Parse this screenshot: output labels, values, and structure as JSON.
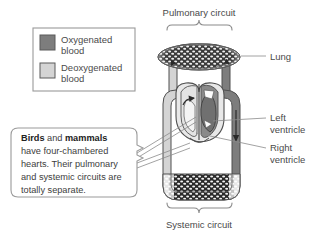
{
  "diagram": {
    "title_top": "Pulmonary circuit",
    "title_bottom": "Systemic circuit",
    "labels": {
      "lung": "Lung",
      "left_ventricle_line1": "Left",
      "left_ventricle_line2": "ventricle",
      "right_ventricle_line1": "Right",
      "right_ventricle_line2": "ventricle"
    }
  },
  "legend": {
    "items": [
      {
        "label_line1": "Oxygenated",
        "label_line2": "blood",
        "swatch_color": "#7d7d7d",
        "name": "oxygenated-blood"
      },
      {
        "label_line1": "Deoxygenated",
        "label_line2": "blood",
        "swatch_color": "#d4d4d4",
        "name": "deoxygenated-blood"
      }
    ]
  },
  "callout": {
    "line1_bold_a": "Birds",
    "line1_mid": " and ",
    "line1_bold_b": "mammals",
    "line2": "have four-chambered",
    "line3": "hearts. Their pulmonary",
    "line4": "and systemic circuits are",
    "line5": "totally separate."
  },
  "colors": {
    "oxygenated": "#7d7d7d",
    "deoxygenated": "#d4d4d4",
    "outline": "#4f4f4f",
    "text": "#4a4a4a",
    "capillary_dark": "#1f1f1f",
    "background": "#ffffff"
  }
}
